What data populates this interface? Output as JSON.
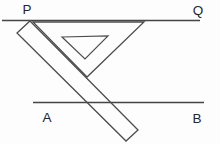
{
  "diagram": {
    "type": "geometry-construction",
    "labels": {
      "p": "P",
      "q": "Q",
      "a": "A",
      "b": "B"
    },
    "colors": {
      "background": "#fdfdfd",
      "line": "#454545",
      "tool_stroke": "#4d4d4d",
      "label": "#262626"
    },
    "shapes": {
      "top_line": "line-PQ",
      "bottom_line": "line-AB",
      "ruler": "inclined-ruler-rectangle",
      "set_square": "set-square-triangle",
      "set_square_hole": "set-square-inner-hole"
    }
  }
}
